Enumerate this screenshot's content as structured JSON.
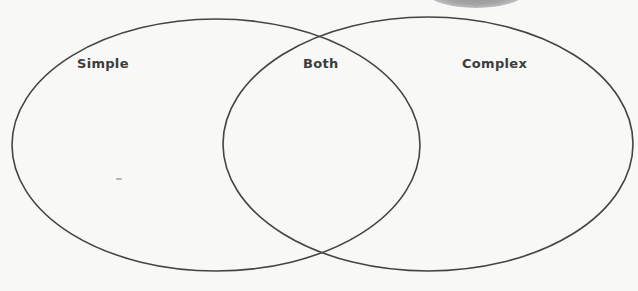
{
  "diagram": {
    "type": "venn",
    "sets": [
      {
        "id": "left",
        "label": "Simple",
        "cx": 216,
        "cy": 145,
        "rx": 204,
        "ry": 126
      },
      {
        "id": "right",
        "label": "Complex",
        "cx": 428,
        "cy": 144,
        "rx": 205,
        "ry": 127
      }
    ],
    "intersection_label": "Both",
    "stroke_color": "#444444",
    "background_color": "#f8f8f7"
  },
  "labels": {
    "left": "Simple",
    "center": "Both",
    "right": "Complex"
  }
}
